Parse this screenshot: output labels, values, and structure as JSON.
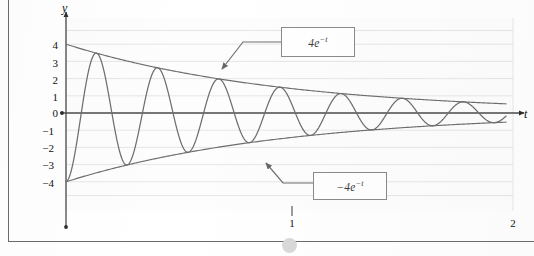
{
  "figure": {
    "axis_labels": {
      "y": "y",
      "t": "t"
    },
    "callouts": [
      {
        "name": "upper-envelope-callout",
        "text_base": "4e",
        "text_exp": "−t",
        "full": "4e^{-t}"
      },
      {
        "name": "lower-envelope-callout",
        "text_base": "−4e",
        "text_exp": "−t",
        "full": "-4e^{-t}"
      }
    ],
    "cursor": {
      "name": "mouse-cursor-dot",
      "color": "#d9d9d9"
    }
  },
  "chart_data": {
    "type": "line",
    "title": "",
    "subtitle": "",
    "xlabel": "t",
    "ylabel": "y",
    "xlim": [
      0,
      2.05
    ],
    "ylim": [
      -4.6,
      4.6
    ],
    "grid": true,
    "grid_orientation": "horizontal",
    "legend_position": "none",
    "x_ticks": [
      1,
      2
    ],
    "x_tick_labels": [
      "1",
      "2"
    ],
    "y_ticks": [
      4,
      3,
      2,
      1,
      0,
      -1,
      -2,
      -3,
      -4
    ],
    "y_tick_labels": [
      "4",
      "3",
      "2",
      "1",
      "0",
      "−1",
      "−2",
      "−3",
      "−4"
    ],
    "series": [
      {
        "name": "damped-oscillation",
        "label": "-4e^{-t} cos(22.4 t)",
        "color": "#6e6e6e",
        "formula": "y = -4*exp(-t)*cos(22.4*t)",
        "amplitude": 4,
        "decay": 1.0,
        "omega": 22.4,
        "phase_deg": 180,
        "sample_points": [
          {
            "t": 0.0,
            "y": -4.0
          },
          {
            "t": 0.14,
            "y": 3.4
          },
          {
            "t": 0.28,
            "y": -2.9
          },
          {
            "t": 0.42,
            "y": 2.5
          },
          {
            "t": 0.56,
            "y": -2.1
          },
          {
            "t": 0.7,
            "y": 1.85
          },
          {
            "t": 0.84,
            "y": -1.6
          },
          {
            "t": 0.98,
            "y": 1.42
          },
          {
            "t": 1.12,
            "y": -1.22
          },
          {
            "t": 1.26,
            "y": 1.07
          },
          {
            "t": 1.4,
            "y": -0.93
          },
          {
            "t": 1.54,
            "y": 0.82
          },
          {
            "t": 1.68,
            "y": -0.71
          },
          {
            "t": 1.82,
            "y": 0.63
          },
          {
            "t": 1.96,
            "y": -0.54
          }
        ]
      },
      {
        "name": "upper-envelope",
        "label": "4e^{-t}",
        "color": "#6e6e6e",
        "formula": "y = 4*exp(-t)",
        "sample_points": [
          {
            "t": 0.0,
            "y": 4.0
          },
          {
            "t": 0.25,
            "y": 3.11
          },
          {
            "t": 0.5,
            "y": 2.43
          },
          {
            "t": 0.75,
            "y": 1.89
          },
          {
            "t": 1.0,
            "y": 1.47
          },
          {
            "t": 1.25,
            "y": 1.15
          },
          {
            "t": 1.5,
            "y": 0.89
          },
          {
            "t": 1.75,
            "y": 0.7
          },
          {
            "t": 2.0,
            "y": 0.54
          }
        ]
      },
      {
        "name": "lower-envelope",
        "label": "-4e^{-t}",
        "color": "#6e6e6e",
        "formula": "y = -4*exp(-t)",
        "sample_points": [
          {
            "t": 0.0,
            "y": -4.0
          },
          {
            "t": 0.25,
            "y": -3.11
          },
          {
            "t": 0.5,
            "y": -2.43
          },
          {
            "t": 0.75,
            "y": -1.89
          },
          {
            "t": 1.0,
            "y": -1.47
          },
          {
            "t": 1.25,
            "y": -1.15
          },
          {
            "t": 1.5,
            "y": -0.89
          },
          {
            "t": 1.75,
            "y": -0.7
          },
          {
            "t": 2.0,
            "y": -0.54
          }
        ]
      },
      {
        "name": "zero-axis-line",
        "label": "t-axis",
        "color": "#4a4a4a",
        "formula": "y = 0"
      }
    ],
    "annotations": [
      {
        "name": "upper-envelope-annotation",
        "text": "4e^{-t}",
        "box_x_px": 281,
        "box_y_px": 27,
        "points_to_t": 0.67,
        "points_to_y": 2.05
      },
      {
        "name": "lower-envelope-annotation",
        "text": "-4e^{-t}",
        "box_x_px": 313,
        "box_y_px": 172,
        "points_to_t": 0.52,
        "points_to_y": -2.12
      }
    ]
  }
}
